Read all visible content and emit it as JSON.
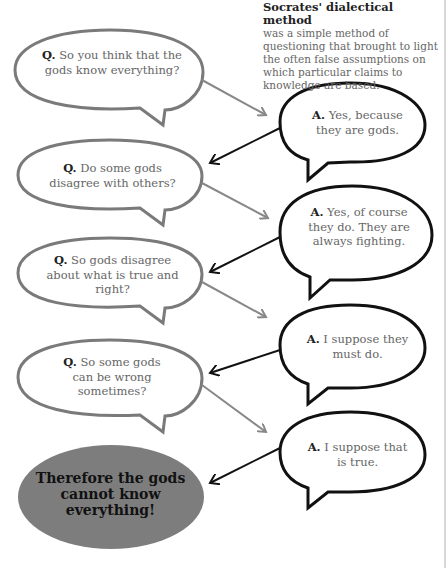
{
  "intro": {
    "title": "Socrates' dialectical method",
    "body": "was a simple method of questioning that brought to light the often false assumptions on which particular claims to knowledge are based."
  },
  "dialogue": [
    {
      "q_label": "Q.",
      "q_text": "So you think that the gods know everything?",
      "a_label": "A.",
      "a_text": "Yes, because they are gods."
    },
    {
      "q_label": "Q.",
      "q_text": "Do some gods disagree with others?",
      "a_label": "A.",
      "a_text": "Yes, of course they do. They are always fighting."
    },
    {
      "q_label": "Q.",
      "q_text": "So gods disagree about what is true and right?",
      "a_label": "A.",
      "a_text": "I suppose they must do."
    },
    {
      "q_label": "Q.",
      "q_text": "So some gods can be wrong sometimes?",
      "a_label": "A.",
      "a_text": "I suppose that is true."
    }
  ],
  "conclusion": "Therefore the gods cannot know everything!",
  "colors": {
    "question_stroke": "#7a7a7a",
    "answer_stroke": "#111111",
    "conclusion_fill": "#7d7d7d"
  }
}
